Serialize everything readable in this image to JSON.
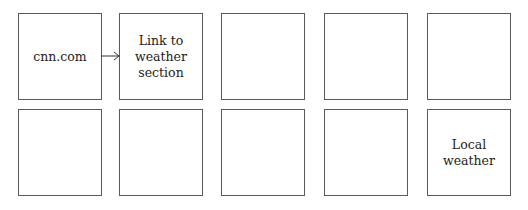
{
  "diagram": {
    "rows": [
      {
        "boxes": [
          {
            "label": "cnn.com"
          },
          {
            "label": "Link to weather section"
          },
          {
            "label": ""
          },
          {
            "label": ""
          },
          {
            "label": ""
          }
        ]
      },
      {
        "boxes": [
          {
            "label": ""
          },
          {
            "label": ""
          },
          {
            "label": ""
          },
          {
            "label": ""
          },
          {
            "label": "Local weather"
          }
        ]
      }
    ],
    "edges": [
      {
        "from": "row0-box0",
        "to": "row0-box1",
        "type": "arrow"
      }
    ]
  }
}
